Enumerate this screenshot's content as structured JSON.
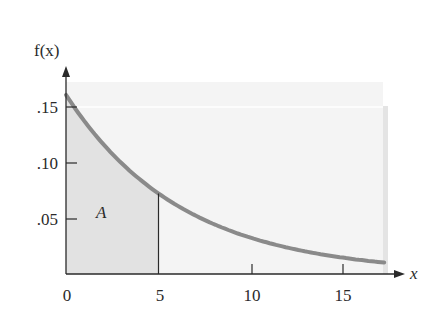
{
  "chart_data": {
    "type": "area",
    "title": "",
    "function": "f(x) = 0.16 e^(-0.16x)",
    "xlabel": "x",
    "ylabel": "f(x)",
    "xlim": [
      0,
      17.5
    ],
    "ylim": [
      0,
      0.18
    ],
    "x_ticks": [
      0,
      5,
      10,
      15
    ],
    "x_tick_labels": [
      "0",
      "5",
      "10",
      "15"
    ],
    "y_ticks": [
      0.05,
      0.1,
      0.15
    ],
    "y_tick_labels": [
      ".05",
      ".10",
      ".15"
    ],
    "series": [
      {
        "name": "f(x)",
        "x": [
          0,
          2.5,
          5,
          7.5,
          10,
          12.5,
          15,
          17.5
        ],
        "values": [
          0.16,
          0.107,
          0.072,
          0.048,
          0.032,
          0.022,
          0.015,
          0.01
        ]
      }
    ],
    "shaded_region": {
      "from": 0,
      "to": 5,
      "label": "A"
    },
    "annotations": [
      {
        "text": "A",
        "x": 2,
        "y": 0.055
      }
    ],
    "grid": false,
    "colors": {
      "curve": "#8a8a8a",
      "shade": "#e6e6e6",
      "panel": "#f4f4f4",
      "axis": "#2a2a2a"
    }
  },
  "labels": {
    "ylabel": "f(x)",
    "xlabel": "x",
    "area": "A",
    "xt0": "0",
    "xt5": "5",
    "xt10": "10",
    "xt15": "15",
    "yt05": ".05",
    "yt10": ".10",
    "yt15": ".15"
  }
}
